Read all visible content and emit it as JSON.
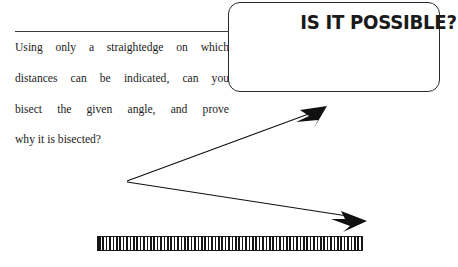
{
  "page": {
    "background_color": "#ffffff",
    "width": 458,
    "height": 267
  },
  "callout": {
    "title": "IS IT POSSIBLE?",
    "border_color": "#2b2b2b",
    "shape": "rounded-rectangle"
  },
  "rule": {
    "color": "#3a3a3a"
  },
  "problem": {
    "line1": "Using only a straightedge on which",
    "line2": "distances can be indicated, can you",
    "line3": "bisect the given angle, and prove",
    "line4": "why it is bisected?",
    "full_text": "Using only a straightedge on which distances can be indicated, can you bisect the given angle, and prove why it is bisected?",
    "text_color": "#1c1c1c"
  },
  "figure": {
    "name": "given-angle",
    "stroke_color": "#111111",
    "vertex": {
      "x": 127,
      "y": 181
    },
    "ray_upper": {
      "tip_x": 327,
      "tip_y": 107,
      "arrowhead": true
    },
    "ray_lower": {
      "tip_x": 367,
      "tip_y": 221,
      "arrowhead": true
    }
  },
  "straightedge": {
    "name": "marked-straightedge",
    "left": 97,
    "top": 236,
    "width": 266,
    "height": 15,
    "hatch_color": "#161616",
    "fill_color": "#ffffff"
  }
}
